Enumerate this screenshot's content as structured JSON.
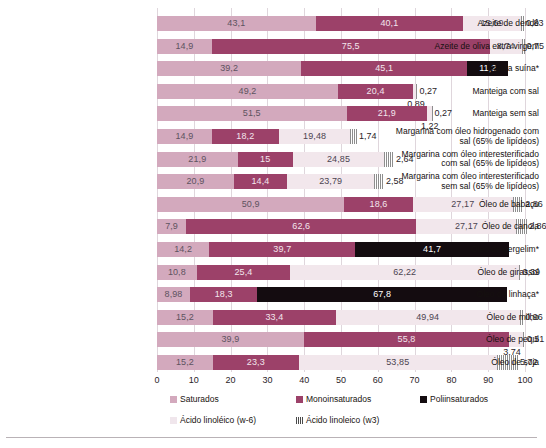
{
  "chart_data": {
    "type": "bar",
    "orientation": "horizontal",
    "stacked": true,
    "title": "",
    "subtitle": "",
    "xlabel": "",
    "ylabel": "",
    "xlim": [
      0,
      100
    ],
    "grid": true,
    "legend_position": "bottom",
    "xticks": [
      0,
      10,
      20,
      30,
      40,
      50,
      60,
      70,
      80,
      90,
      100
    ],
    "xtick_labels": [
      "0",
      "10",
      "20",
      "30",
      "40",
      "50",
      "60",
      "70",
      "80",
      "90",
      "100"
    ],
    "series": [
      {
        "name": "Saturados",
        "color": "#d3a9bd",
        "key": "sat"
      },
      {
        "name": "Monoinsaturados",
        "color": "#9c4169",
        "key": "mono"
      },
      {
        "name": "Poliinsaturados",
        "color": "#140c10",
        "key": "poli"
      },
      {
        "name": "Ácido linoléico (w-6)",
        "color": "#f2e7ec",
        "key": "w6"
      },
      {
        "name": "Ácido linoleico (w3)",
        "color": "#efe6eb",
        "key": "w3"
      }
    ],
    "categories": [
      "Azeite de dendê",
      "Azeite de oliva extra virgem",
      "Banha suína*",
      "Manteiga com sal",
      "Manteiga sem sal",
      "Margarina com óleo hidrogenado com sal (65% de lipídeos)",
      "Margarina com óleo interesterificado com sal (65% de lipídeos)",
      "Margarina com óleo interesterificado sem sal (65% de lipídeos)",
      "Óleo de babaçu",
      "Óleo de canola",
      "Óleo de gergelim*",
      "Óleo de girassol",
      "Óleo de linhaça*",
      "Óleo de milho",
      "Óleo de pequi",
      "Óleo de soja"
    ],
    "rows": [
      {
        "category": "Azeite de dendê",
        "label_lines": [
          "Azeite de dendê"
        ],
        "sat": 43.1,
        "sat_label": "43,1",
        "mono": 40.1,
        "mono_label": "40,1",
        "poli": 0,
        "poli_label": "",
        "w6": 15.69,
        "w6_label": "15,69",
        "w3": 0.83,
        "w3_label": "0,83"
      },
      {
        "category": "Azeite de oliva extra virgem",
        "label_lines": [
          "Azeite de oliva extra virgem"
        ],
        "sat": 14.9,
        "sat_label": "14,9",
        "mono": 75.5,
        "mono_label": "75,5",
        "poli": 0,
        "poli_label": "",
        "w6": 8.74,
        "w6_label": "8,74",
        "w3": 0.75,
        "w3_label": "0,75"
      },
      {
        "category": "Banha suína*",
        "label_lines": [
          "Banha suína*"
        ],
        "sat": 39.2,
        "sat_label": "39,2",
        "mono": 45.1,
        "mono_label": "45,1",
        "poli": 11.2,
        "poli_label": "11,2",
        "w6": 0,
        "w6_label": "",
        "w3": 0,
        "w3_label": ""
      },
      {
        "category": "Manteiga com sal",
        "label_lines": [
          "Manteiga com sal"
        ],
        "sat": 49.2,
        "sat_label": "49,2",
        "mono": 20.4,
        "mono_label": "20,4",
        "poli": 0,
        "poli_label": "",
        "w6": 0.89,
        "w6_label": "0,89",
        "w3": 0.27,
        "w3_label": "0,27"
      },
      {
        "category": "Manteiga sem sal",
        "label_lines": [
          "Manteiga sem sal"
        ],
        "sat": 51.5,
        "sat_label": "51,5",
        "mono": 21.9,
        "mono_label": "21,9",
        "poli": 0,
        "poli_label": "",
        "w6": 1.22,
        "w6_label": "1,22",
        "w3": 0.27,
        "w3_label": "0,27"
      },
      {
        "category": "Margarina com óleo hidrogenado com sal (65% de lipídeos)",
        "label_lines": [
          "Margarina com óleo hidrogenado com",
          "sal (65% de lipídeos)"
        ],
        "sat": 14.9,
        "sat_label": "14,9",
        "mono": 18.2,
        "mono_label": "18,2",
        "poli": 0,
        "poli_label": "",
        "w6": 19.48,
        "w6_label": "19,48",
        "w3": 1.74,
        "w3_label": "1,74"
      },
      {
        "category": "Margarina com óleo interesterificado com sal (65% de lipídeos)",
        "label_lines": [
          "Margarina com óleo interesterificado",
          "com sal (65% de lipídeos)"
        ],
        "sat": 21.9,
        "sat_label": "21,9",
        "mono": 15,
        "mono_label": "15",
        "poli": 0,
        "poli_label": "",
        "w6": 24.85,
        "w6_label": "24,85",
        "w3": 2.64,
        "w3_label": "2,64"
      },
      {
        "category": "Margarina com óleo interesterificado sem sal (65% de lipídeos)",
        "label_lines": [
          "Margarina com óleo interesterificado",
          "sem sal (65% de lipídeos)"
        ],
        "sat": 20.9,
        "sat_label": "20,9",
        "mono": 14.4,
        "mono_label": "14,4",
        "poli": 0,
        "poli_label": "",
        "w6": 23.79,
        "w6_label": "23,79",
        "w3": 2.58,
        "w3_label": "2,58"
      },
      {
        "category": "Óleo de babaçu",
        "label_lines": [
          "Óleo de babaçu"
        ],
        "sat": 50.9,
        "sat_label": "50,9",
        "mono": 18.6,
        "mono_label": "18,6",
        "poli": 0,
        "poli_label": "",
        "w6": 27.17,
        "w6_label": "27,17",
        "w3": 2.86,
        "w3_label": "2,86"
      },
      {
        "category": "Óleo de canola",
        "label_lines": [
          "Óleo de canola"
        ],
        "sat": 7.9,
        "sat_label": "7,9",
        "mono": 62.6,
        "mono_label": "62,6",
        "poli": 0,
        "poli_label": "",
        "w6": 27.17,
        "w6_label": "27,17",
        "w3": 2.86,
        "w3_label": "2,86"
      },
      {
        "category": "Óleo de gergelim*",
        "label_lines": [
          "Óleo de gergelim*"
        ],
        "sat": 14.2,
        "sat_label": "14,2",
        "mono": 39.7,
        "mono_label": "39,7",
        "poli": 41.7,
        "poli_label": "41,7",
        "w6": 0,
        "w6_label": "",
        "w3": 0,
        "w3_label": ""
      },
      {
        "category": "Óleo de girassol",
        "label_lines": [
          "Óleo de girassol"
        ],
        "sat": 10.8,
        "sat_label": "10,8",
        "mono": 25.4,
        "mono_label": "25,4",
        "poli": 0,
        "poli_label": "",
        "w6": 62.22,
        "w6_label": "62,22",
        "w3": 0.39,
        "w3_label": "0,39"
      },
      {
        "category": "Óleo de linhaça*",
        "label_lines": [
          "Óleo de linhaça*"
        ],
        "sat": 8.98,
        "sat_label": "8,98",
        "mono": 18.3,
        "mono_label": "18,3",
        "poli": 67.8,
        "poli_label": "67,8",
        "w6": 0,
        "w6_label": "",
        "w3": 0,
        "w3_label": ""
      },
      {
        "category": "Óleo de milho",
        "label_lines": [
          "Óleo de milho"
        ],
        "sat": 15.2,
        "sat_label": "15,2",
        "mono": 33.4,
        "mono_label": "33,4",
        "poli": 0,
        "poli_label": "",
        "w6": 49.94,
        "w6_label": "49,94",
        "w3": 0.96,
        "w3_label": "0,96"
      },
      {
        "category": "Óleo de pequi",
        "label_lines": [
          "Óleo de pequi"
        ],
        "sat": 39.9,
        "sat_label": "39,9",
        "mono": 55.8,
        "mono_label": "55,8",
        "poli": 0,
        "poli_label": "",
        "w6": 3.74,
        "w6_label": "3,74",
        "w3": 0.51,
        "w3_label": "0,51"
      },
      {
        "category": "Óleo de soja",
        "label_lines": [
          "Óleo de soja"
        ],
        "sat": 15.2,
        "sat_label": "15,2",
        "mono": 23.3,
        "mono_label": "23,3",
        "poli": 0,
        "poli_label": "",
        "w6": 53.85,
        "w6_label": "53,85",
        "w3": 5.72,
        "w3_label": "5,72"
      }
    ]
  },
  "legend": {
    "row1": [
      {
        "label": "Saturados",
        "swatch": "sw-sat",
        "left": 170
      },
      {
        "label": "Monoinsaturados",
        "swatch": "sw-mono",
        "left": 296
      },
      {
        "label": "Poliinsaturados",
        "swatch": "sw-poli",
        "left": 420
      }
    ],
    "row2": [
      {
        "label": "Ácido linoléico (w-6)",
        "swatch": "sw-w6",
        "left": 170
      },
      {
        "label": "Ácido linoleico (w3)",
        "swatch": "sw-w3",
        "left": 296
      }
    ]
  }
}
